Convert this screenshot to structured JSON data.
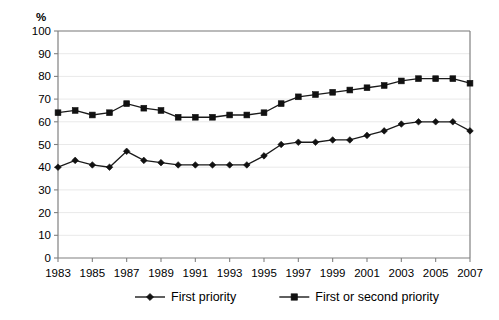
{
  "chart_data": {
    "type": "line",
    "title": "",
    "xlabel": "",
    "ylabel": "%",
    "ylim": [
      0,
      100
    ],
    "xlim": [
      1983,
      2007
    ],
    "grid": true,
    "legend_position": "bottom",
    "x": [
      1983,
      1984,
      1985,
      1986,
      1987,
      1988,
      1989,
      1990,
      1991,
      1992,
      1993,
      1994,
      1995,
      1996,
      1997,
      1998,
      1999,
      2000,
      2001,
      2002,
      2003,
      2004,
      2005,
      2006,
      2007
    ],
    "xtick_labels": [
      "1983",
      "1985",
      "1987",
      "1989",
      "1991",
      "1993",
      "1995",
      "1997",
      "1999",
      "2001",
      "2003",
      "2005",
      "2007"
    ],
    "xticks": [
      1983,
      1985,
      1987,
      1989,
      1991,
      1993,
      1995,
      1997,
      1999,
      2001,
      2003,
      2005,
      2007
    ],
    "ytick_labels": [
      "0",
      "10",
      "20",
      "30",
      "40",
      "50",
      "60",
      "70",
      "80",
      "90",
      "100"
    ],
    "yticks": [
      0,
      10,
      20,
      30,
      40,
      50,
      60,
      70,
      80,
      90,
      100
    ],
    "series": [
      {
        "name": "First priority",
        "marker": "diamond",
        "color": "#111111",
        "values": [
          40,
          43,
          41,
          40,
          47,
          43,
          42,
          41,
          41,
          41,
          41,
          41,
          45,
          50,
          51,
          51,
          52,
          52,
          54,
          56,
          59,
          60,
          60,
          60,
          56
        ]
      },
      {
        "name": "First or second priority",
        "marker": "square",
        "color": "#111111",
        "values": [
          64,
          65,
          63,
          64,
          68,
          66,
          65,
          62,
          62,
          62,
          63,
          63,
          64,
          68,
          71,
          72,
          73,
          74,
          75,
          76,
          78,
          79,
          79,
          79,
          77
        ]
      }
    ]
  },
  "axis": {
    "y_unit_label": "%"
  },
  "legend": {
    "entries": [
      {
        "label": "First priority",
        "marker": "diamond"
      },
      {
        "label": "First or second priority",
        "marker": "square"
      }
    ]
  },
  "caption": {
    "partial_text": ""
  }
}
